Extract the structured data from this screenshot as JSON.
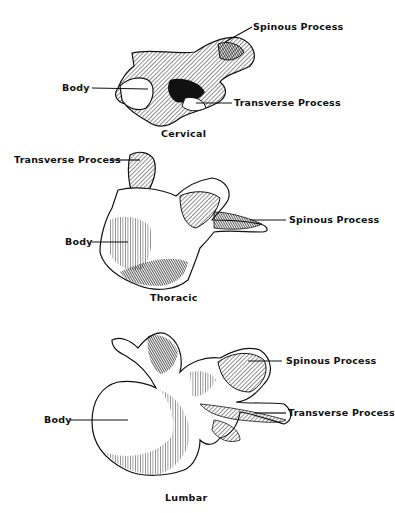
{
  "diagram": {
    "panels": [
      {
        "caption": "Cervical",
        "labels": {
          "spinous": "Spinous Process",
          "body": "Body",
          "transverse": "Transverse Process"
        }
      },
      {
        "caption": "Thoracic",
        "labels": {
          "transverse": "Transverse Process",
          "spinous": "Spinous Process",
          "body": "Body"
        }
      },
      {
        "caption": "Lumbar",
        "labels": {
          "spinous": "Spinous Process",
          "body": "Body",
          "transverse": "Transverse Process"
        }
      }
    ]
  }
}
